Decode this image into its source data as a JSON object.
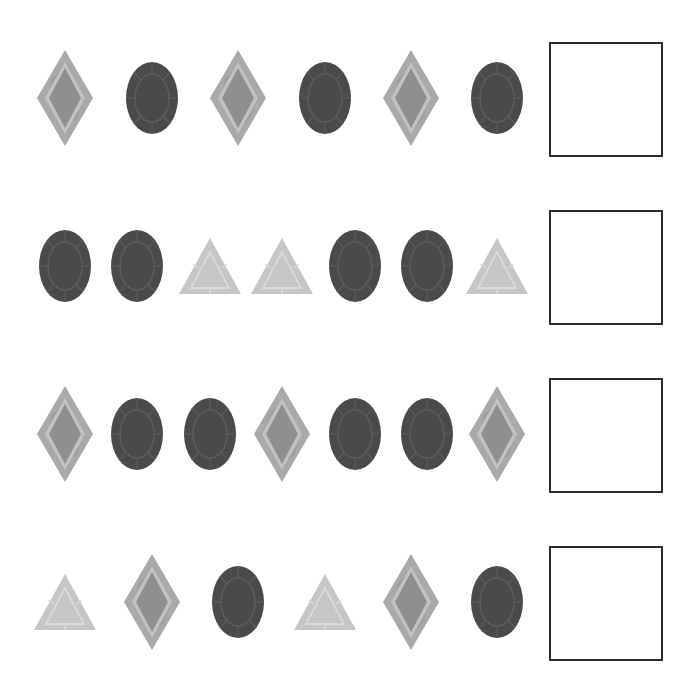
{
  "worksheet": {
    "task": "Complete the pattern",
    "colors": {
      "diamond_outer": "#a9a9a9",
      "diamond_inner": "#8f8f8f",
      "diamond_facet": "#c2c2c2",
      "oval_fill": "#4a4a4a",
      "oval_facet": "#5c5c5c",
      "triangle_fill": "#c6c6c6",
      "triangle_facet": "#dadada",
      "box_border": "#2a2a2a"
    },
    "rows": [
      {
        "items": [
          "diamond",
          "oval",
          "diamond",
          "oval",
          "diamond",
          "oval"
        ],
        "x": [
          65,
          152,
          238,
          325,
          411,
          497
        ],
        "answer": ""
      },
      {
        "items": [
          "oval",
          "oval",
          "triangle",
          "triangle",
          "oval",
          "oval",
          "triangle"
        ],
        "x": [
          65,
          137,
          210,
          282,
          355,
          427,
          497
        ],
        "answer": ""
      },
      {
        "items": [
          "diamond",
          "oval",
          "oval",
          "diamond",
          "oval",
          "oval",
          "diamond"
        ],
        "x": [
          65,
          137,
          210,
          282,
          355,
          427,
          497
        ],
        "answer": ""
      },
      {
        "items": [
          "triangle",
          "diamond",
          "oval",
          "triangle",
          "diamond",
          "oval"
        ],
        "x": [
          65,
          152,
          238,
          325,
          411,
          497
        ],
        "answer": ""
      }
    ],
    "row_center_y": [
      98,
      266,
      434,
      602
    ],
    "box_top_y": [
      42,
      210,
      378,
      546
    ]
  }
}
